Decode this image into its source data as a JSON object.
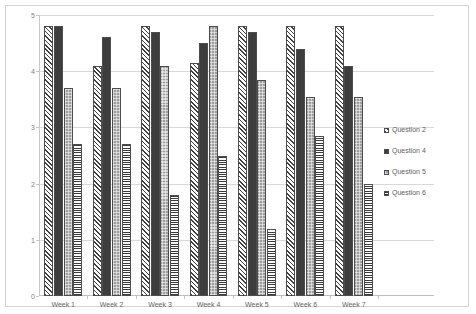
{
  "chart_data": {
    "type": "bar",
    "title": "",
    "subtitle": "",
    "xlabel": "",
    "ylabel": "",
    "ylim": [
      0,
      5
    ],
    "yticks": [
      0,
      1,
      2,
      3,
      4,
      5
    ],
    "ytick_labels": [
      "0",
      "1",
      "2",
      "3",
      "4",
      "5"
    ],
    "grid": true,
    "legend_position": "right",
    "categories": [
      "Week 1",
      "Week 2",
      "Week 3",
      "Week 4",
      "Week 5",
      "Week 6",
      "Week 7"
    ],
    "series": [
      {
        "name": "Question 2",
        "pattern": "diagonal-hatch",
        "values": [
          4.8,
          4.1,
          4.8,
          4.15,
          4.8,
          4.8,
          4.8
        ]
      },
      {
        "name": "Question 4",
        "pattern": "solid-dark",
        "values": [
          4.8,
          4.6,
          4.7,
          4.5,
          4.7,
          4.4,
          4.1
        ]
      },
      {
        "name": "Question 5",
        "pattern": "light-gray-dotted",
        "values": [
          3.7,
          3.7,
          4.1,
          4.8,
          3.85,
          3.55,
          3.55
        ]
      },
      {
        "name": "Question 6",
        "pattern": "horizontal-stripes",
        "values": [
          2.7,
          2.7,
          1.8,
          2.5,
          1.2,
          2.85,
          2.0
        ]
      }
    ]
  },
  "colors": {
    "series_q2_line": "#3f3f3f",
    "series_q4_fill": "#3d3d3d",
    "series_q5_fill": "#9e9e9e",
    "series_q6_line": "#3a3a3a",
    "gridline": "#d9d9d9",
    "axis": "#c8c8c8",
    "border": "#d4d4d4",
    "text": "#666666",
    "background": "#ffffff"
  }
}
